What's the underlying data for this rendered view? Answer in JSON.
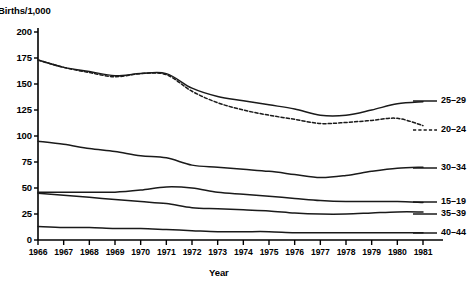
{
  "chart_data": {
    "type": "line",
    "title": "",
    "subtitle": "",
    "ylabel": "Births/1,000",
    "xlabel": "Year",
    "grid": false,
    "legend_position": "right-inline",
    "x": [
      1966,
      1967,
      1968,
      1969,
      1970,
      1971,
      1972,
      1973,
      1974,
      1975,
      1976,
      1977,
      1978,
      1979,
      1980,
      1981
    ],
    "xlim": [
      1966,
      1981
    ],
    "ylim": [
      0,
      200
    ],
    "ytick_labels": [
      "0",
      "25",
      "50",
      "75",
      "100",
      "125",
      "150",
      "175",
      "200"
    ],
    "yticks": [
      0,
      25,
      50,
      75,
      100,
      125,
      150,
      175,
      200
    ],
    "xtick_labels": [
      "1966",
      "1967",
      "1968",
      "1969",
      "1970",
      "1971",
      "1972",
      "1973",
      "1974",
      "1975",
      "1976",
      "1977",
      "1978",
      "1979",
      "1980",
      "1981"
    ],
    "series": [
      {
        "name": "25-29",
        "label": "25–29",
        "style": "solid",
        "color": "#1a1a1a",
        "values": [
          173,
          166,
          162,
          158,
          160,
          160,
          146,
          138,
          134,
          130,
          126,
          120,
          120,
          125,
          131,
          133
        ]
      },
      {
        "name": "20-24",
        "label": "20–24",
        "style": "dashed",
        "color": "#1a1a1a",
        "values": [
          173,
          166,
          161,
          157,
          160,
          159,
          143,
          132,
          125,
          120,
          116,
          112,
          113,
          115,
          117,
          110
        ]
      },
      {
        "name": "30-34",
        "label": "30–34",
        "style": "solid",
        "color": "#1a1a1a",
        "values": [
          95,
          92,
          88,
          85,
          81,
          79,
          72,
          70,
          68,
          66,
          63,
          60,
          62,
          66,
          69,
          70
        ]
      },
      {
        "name": "15-19",
        "label": "15–19",
        "style": "solid",
        "color": "#1a1a1a",
        "values": [
          46,
          46,
          46,
          46,
          48,
          51,
          50,
          46,
          44,
          42,
          40,
          38,
          37,
          37,
          37,
          36
        ]
      },
      {
        "name": "35-39",
        "label": "35–39",
        "style": "solid",
        "color": "#1a1a1a",
        "values": [
          45,
          43,
          41,
          39,
          37,
          35,
          31,
          30,
          29,
          28,
          26,
          25,
          25,
          26,
          27,
          27
        ]
      },
      {
        "name": "40-44",
        "label": "40–44",
        "style": "solid",
        "color": "#1a1a1a",
        "values": [
          13,
          12,
          12,
          11,
          11,
          10,
          9,
          8,
          8,
          8,
          7,
          7,
          7,
          7,
          7,
          7
        ]
      }
    ]
  },
  "axes": {
    "y_title": "Births/1,000",
    "x_title": "Year"
  },
  "legend": {
    "items": [
      {
        "label": "25–29"
      },
      {
        "label": "20–24"
      },
      {
        "label": "30–34"
      },
      {
        "label": "15–19"
      },
      {
        "label": "35–39"
      },
      {
        "label": "40–44"
      }
    ]
  },
  "ticks": {
    "y": [
      "200",
      "175",
      "150",
      "125",
      "100",
      "75",
      "50",
      "25",
      "0"
    ],
    "x": [
      "1966",
      "1967",
      "1968",
      "1969",
      "1970",
      "1971",
      "1972",
      "1973",
      "1974",
      "1975",
      "1976",
      "1977",
      "1978",
      "1979",
      "1980",
      "1981"
    ]
  }
}
